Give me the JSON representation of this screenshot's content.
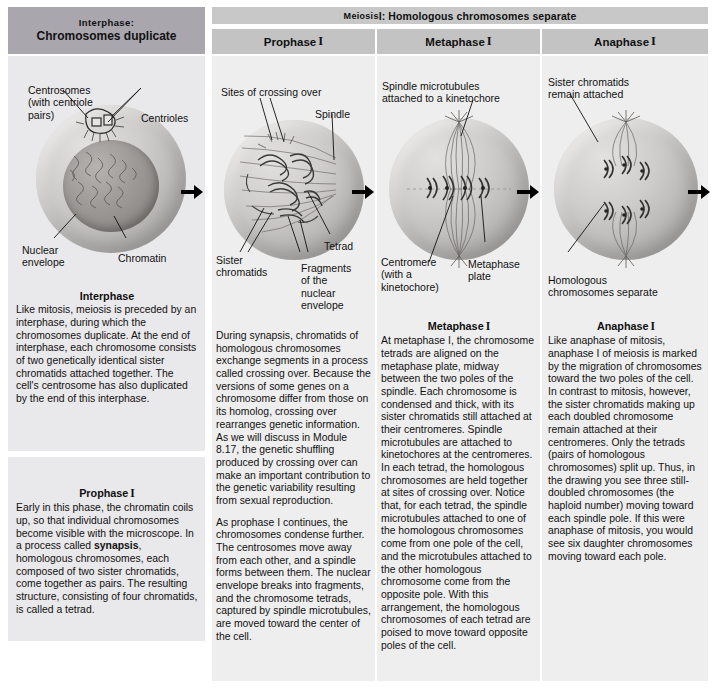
{
  "figure": {
    "meiosis_banner": {
      "smallcaps": "Meiosis",
      "rest": " I: Homologous chromosomes separate"
    }
  },
  "interphase": {
    "header_line1": "Interphase:",
    "header_line2": "Chromosomes duplicate",
    "labels": {
      "centrosomes": "Centrosomes\n(with centriole\npairs)",
      "centrioles": "Centrioles",
      "nuclear_envelope": "Nuclear\nenvelope",
      "chromatin": "Chromatin"
    },
    "caption": {
      "title": "Interphase",
      "body": "Like mitosis, meiosis is preceded by an interphase, during which the chromosomes duplicate. At the end of interphase, each chromosome consists of two genetically identical sister chromatids attached together. The cell's centrosome has also duplicated by the end of this interphase."
    },
    "prophase_caption": {
      "title": "Prophase",
      "roman": "I",
      "part1": "Early in this phase, the chromatin coils up, so that individual chromosomes become visible with the microscope. In a process called ",
      "bold": "synapsis",
      "part2": ", homologous chromosomes, each composed of two sister chromatids, come together as pairs. The resulting structure, consisting of four chromatids, is called a tetrad."
    }
  },
  "prophase": {
    "header": "Prophase",
    "header_roman": "I",
    "labels": {
      "crossing_over": "Sites of crossing over",
      "spindle": "Spindle",
      "tetrad": "Tetrad",
      "sister_chromatids": "Sister\nchromatids",
      "fragments": "Fragments\nof the\nnuclear\nenvelope"
    },
    "caption": {
      "para1": "During synapsis, chromatids of homologous chromosomes exchange segments in a process called crossing over. Because the versions of some genes on a chromosome differ from those on its homolog, crossing over rearranges genetic information. As we will discuss in Module 8.17, the genetic shuffling produced by crossing over can make an important contribution to the genetic variability resulting from sexual reproduction.",
      "para2": "As prophase I continues, the chromosomes condense further. The centrosomes move away from each other, and a spindle forms between them. The nuclear envelope breaks into fragments, and the chromosome tetrads, captured by spindle microtubules, are moved toward the center of the cell."
    }
  },
  "metaphase": {
    "header": "Metaphase",
    "header_roman": "I",
    "labels": {
      "spindle_microtubules": "Spindle microtubules\nattached to a kinetochore",
      "centromere": "Centromere\n(with a\nkinetochore)",
      "metaphase_plate": "Metaphase\nplate"
    },
    "caption": {
      "title": "Metaphase",
      "roman": "I",
      "body": "At metaphase I, the chromosome tetrads are aligned on the metaphase plate, midway between the two poles of the spindle. Each chromosome is condensed and thick, with its sister chromatids still attached at their centromeres. Spindle microtubules are attached to kinetochores at the centromeres. In each tetrad, the homologous chromosomes are held together at sites of crossing over. Notice that, for each tetrad, the spindle microtubules attached to one of the homologous chromosomes come from one pole of the cell, and the microtubules attached to the other homologous chromosome come from the opposite pole. With this arrangement, the homologous chromosomes of each tetrad are poised to move toward opposite poles of the cell."
    }
  },
  "anaphase": {
    "header": "Anaphase",
    "header_roman": "I",
    "labels": {
      "sister_chromatids": "Sister chromatids\nremain attached",
      "homologous_separate": "Homologous\nchromosomes separate"
    },
    "caption": {
      "title": "Anaphase",
      "roman": "I",
      "body": "Like anaphase of mitosis, anaphase I of meiosis is marked by the migration of chromosomes toward the two poles of the cell. In contrast to mitosis, however, the sister chromatids making up each doubled chromosome remain attached at their centromeres. Only the tetrads (pairs of homologous chromosomes) split up. Thus, in the drawing you see three still-doubled chromosomes (the haploid number) moving toward each spindle pole. If this were anaphase of mitosis, you would see six daughter chromosomes moving toward each pole."
    }
  },
  "colors": {
    "banner": "#c8c8c8",
    "phase_header": "#c3c3c3",
    "interphase_header": "#a9a6ae",
    "panel": "#eeeeee",
    "interphase_panel": "#e9e8ea"
  }
}
